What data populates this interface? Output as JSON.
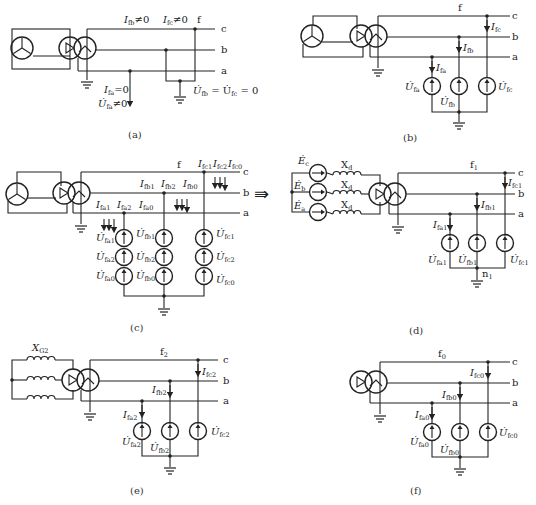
{
  "figure": {
    "panels": [
      {
        "id": "a",
        "caption": "(a)",
        "node_label": "f",
        "phase_labels": [
          "c",
          "b",
          "a"
        ],
        "annotations": {
          "ifb": "I",
          "ifb_sub": "fb",
          "ifb_rel": "≠0",
          "ifc": "I",
          "ifc_sub": "fc",
          "ifc_rel": "≠0",
          "ifa": "I",
          "ifa_sub": "fa",
          "ifa_rel": "=0",
          "ufa": "U̇",
          "ufa_sub": "fa",
          "ufa_rel": "≠0",
          "ufb_ufc": "U̇",
          "ufb_sub": "fb",
          "eq": " = U̇",
          "ufc_sub": "fc",
          "eq0": " = 0"
        }
      },
      {
        "id": "b",
        "caption": "(b)",
        "node_label": "f",
        "phase_labels": [
          "c",
          "b",
          "a"
        ],
        "currents": [
          {
            "sym": "I",
            "sub": "fa"
          },
          {
            "sym": "I",
            "sub": "fb"
          },
          {
            "sym": "I",
            "sub": "fc"
          }
        ],
        "sources": [
          {
            "sym": "U̇",
            "sub": "fa"
          },
          {
            "sym": "U̇",
            "sub": "fb"
          },
          {
            "sym": "U̇",
            "sub": "fc"
          }
        ]
      },
      {
        "id": "c",
        "caption": "(c)",
        "node_label": "f",
        "phase_labels": [
          "c",
          "b",
          "a"
        ],
        "currents_a": [
          {
            "sym": "I",
            "sub": "fa1"
          },
          {
            "sym": "I",
            "sub": "fa2"
          },
          {
            "sym": "I",
            "sub": "fa0"
          }
        ],
        "currents_b": [
          {
            "sym": "I",
            "sub": "fb1"
          },
          {
            "sym": "I",
            "sub": "fb2"
          },
          {
            "sym": "I",
            "sub": "fb0"
          }
        ],
        "currents_c": [
          {
            "sym": "I",
            "sub": "fc1"
          },
          {
            "sym": "I",
            "sub": "fc2"
          },
          {
            "sym": "I",
            "sub": "fc0"
          }
        ],
        "sources_a": [
          {
            "sym": "U̇",
            "sub": "fa1"
          },
          {
            "sym": "U̇",
            "sub": "fa2"
          },
          {
            "sym": "U̇",
            "sub": "fa0"
          }
        ],
        "sources_b": [
          {
            "sym": "U̇",
            "sub": "fb1"
          },
          {
            "sym": "U̇",
            "sub": "fb2"
          },
          {
            "sym": "U̇",
            "sub": "fb0"
          }
        ],
        "sources_c": [
          {
            "sym": "U̇",
            "sub": "fc1"
          },
          {
            "sym": "U̇",
            "sub": "fc2"
          },
          {
            "sym": "U̇",
            "sub": "fc0"
          }
        ],
        "arrow_symbol": "⇛"
      },
      {
        "id": "d",
        "caption": "(d)",
        "node_label": "f",
        "node_sub": "1",
        "neutral_label": "n",
        "neutral_sub": "1",
        "phase_labels": [
          "c",
          "b",
          "a"
        ],
        "emfs": [
          {
            "sym": "Ė",
            "sub": "c"
          },
          {
            "sym": "Ė",
            "sub": "b"
          },
          {
            "sym": "Ė",
            "sub": "a"
          }
        ],
        "reactance": {
          "sym": "X",
          "sub": "d"
        },
        "currents": [
          {
            "sym": "I",
            "sub": "fa1"
          },
          {
            "sym": "I",
            "sub": "fb1"
          },
          {
            "sym": "I",
            "sub": "fc1"
          }
        ],
        "sources": [
          {
            "sym": "U̇",
            "sub": "fa1"
          },
          {
            "sym": "U̇",
            "sub": "fb1"
          },
          {
            "sym": "U̇",
            "sub": "fc1"
          }
        ]
      },
      {
        "id": "e",
        "caption": "(e)",
        "node_label": "f",
        "node_sub": "2",
        "phase_labels": [
          "c",
          "b",
          "a"
        ],
        "reactance": {
          "sym": "X",
          "sub": "G2"
        },
        "currents": [
          {
            "sym": "I",
            "sub": "fa2"
          },
          {
            "sym": "I",
            "sub": "fb2"
          },
          {
            "sym": "I",
            "sub": "fc2"
          }
        ],
        "sources": [
          {
            "sym": "U̇",
            "sub": "fa2"
          },
          {
            "sym": "U̇",
            "sub": "fb2"
          },
          {
            "sym": "U̇",
            "sub": "fc2"
          }
        ]
      },
      {
        "id": "f",
        "caption": "(f)",
        "node_label": "f",
        "node_sub": "0",
        "phase_labels": [
          "c",
          "b",
          "a"
        ],
        "currents": [
          {
            "sym": "I",
            "sub": "fa0"
          },
          {
            "sym": "I",
            "sub": "fb0"
          },
          {
            "sym": "I",
            "sub": "fc0"
          }
        ],
        "sources": [
          {
            "sym": "U̇",
            "sub": "fa0"
          },
          {
            "sym": "U̇",
            "sub": "fb0"
          },
          {
            "sym": "U̇",
            "sub": "fc0"
          }
        ]
      }
    ],
    "colors": {
      "line": "#222222",
      "background": "#ffffff"
    }
  }
}
